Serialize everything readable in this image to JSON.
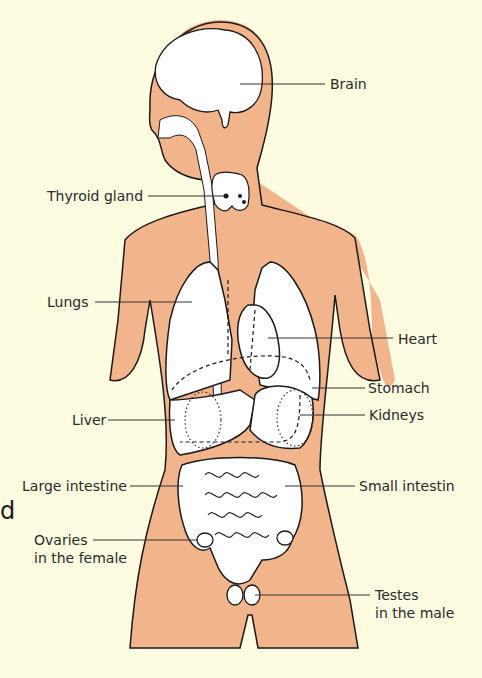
{
  "diagram": {
    "colors": {
      "background": "#fdfbe0",
      "skin": "#f2b48a",
      "organ_fill": "#ffffff",
      "outline": "#1a1a1a",
      "leader_line": "#333333"
    },
    "labels": {
      "brain": "Brain",
      "thyroid": "Thyroid gland",
      "lungs": "Lungs",
      "heart": "Heart",
      "stomach": "Stomach",
      "liver": "Liver",
      "kidneys": "Kidneys",
      "large_intestine": "Large intestine",
      "small_intestine": "Small intestin",
      "ovaries_line1": "Ovaries",
      "ovaries_line2": "in the female",
      "testes_line1": "Testes",
      "testes_line2": "in the male"
    },
    "cropped_glyph": "d"
  }
}
